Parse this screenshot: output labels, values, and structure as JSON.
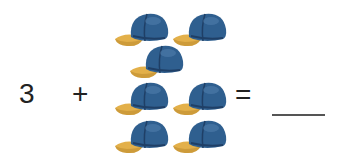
{
  "equation": {
    "addend": "3",
    "operator": "+",
    "equals": "=",
    "answer": ""
  },
  "objects": {
    "name": "baseball-cap",
    "count": 7,
    "colors": {
      "crown": "#2f5f8f",
      "crown_dark": "#1f3f66",
      "brim": "#e3b04a",
      "brim_dark": "#b8862a"
    },
    "positions": [
      {
        "x": 113,
        "y": 9
      },
      {
        "x": 171,
        "y": 9
      },
      {
        "x": 128,
        "y": 41
      },
      {
        "x": 113,
        "y": 78
      },
      {
        "x": 171,
        "y": 78
      },
      {
        "x": 113,
        "y": 116
      },
      {
        "x": 171,
        "y": 116
      }
    ]
  }
}
